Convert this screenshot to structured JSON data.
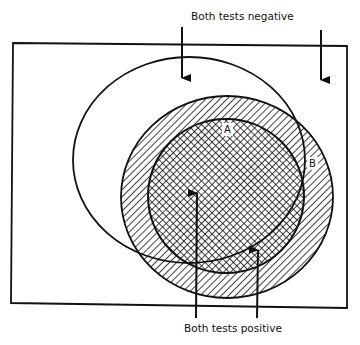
{
  "diagram": {
    "labels": {
      "top": "Both tests negative",
      "bottom": "Both tests positive",
      "region_a": "A",
      "region_b": "B"
    },
    "colors": {
      "ink": "#111111",
      "background": "#ffffff"
    },
    "regions": [
      {
        "id": "universe",
        "description": "rectangle (population)"
      },
      {
        "id": "test-1-negative-ellipse",
        "description": "open ellipse, no fill"
      },
      {
        "id": "hatched-circle",
        "description": "diagonal hatching",
        "label": "B"
      },
      {
        "id": "crosshatched-circle",
        "description": "cross-hatching",
        "label": "A"
      }
    ]
  }
}
